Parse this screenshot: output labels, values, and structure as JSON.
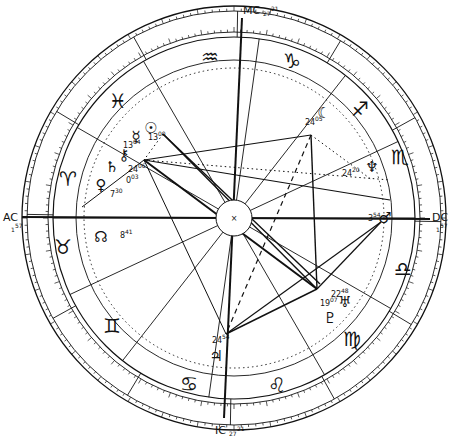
{
  "chart": {
    "center": [
      234,
      218
    ],
    "radii": {
      "outer": 212,
      "outer2": 207,
      "zodiac_inner": 186,
      "zodiac_inner2": 181,
      "house": 158,
      "hub": 18
    },
    "colors": {
      "line": "#111111",
      "background": "#ffffff"
    }
  },
  "angles": {
    "ac": {
      "label": "AC",
      "deg": "1",
      "min": "57"
    },
    "dc": {
      "label": "DC",
      "deg": "1",
      "min": "57"
    },
    "mc": {
      "label": "MC",
      "deg": "27",
      "min": "21"
    },
    "ic": {
      "label": "IC",
      "deg": "27",
      "min": "21"
    }
  },
  "signs": [
    {
      "name": "aquarius",
      "glyph": "♒",
      "x": 210,
      "y": 58
    },
    {
      "name": "capricorn",
      "glyph": "♑",
      "x": 292,
      "y": 62
    },
    {
      "name": "sagittarius",
      "glyph": "♐",
      "x": 360,
      "y": 110
    },
    {
      "name": "scorpio",
      "glyph": "♏",
      "x": 400,
      "y": 158
    },
    {
      "name": "libra",
      "glyph": "♎",
      "x": 403,
      "y": 270
    },
    {
      "name": "virgo",
      "glyph": "♍",
      "x": 352,
      "y": 340
    },
    {
      "name": "leo",
      "glyph": "♌",
      "x": 277,
      "y": 386
    },
    {
      "name": "cancer",
      "glyph": "♋",
      "x": 189,
      "y": 385
    },
    {
      "name": "gemini",
      "glyph": "♊",
      "x": 112,
      "y": 327
    },
    {
      "name": "taurus",
      "glyph": "♉",
      "x": 63,
      "y": 248
    },
    {
      "name": "aries",
      "glyph": "♈",
      "x": 68,
      "y": 180
    },
    {
      "name": "pisces",
      "glyph": "♓",
      "x": 118,
      "y": 102
    }
  ],
  "planets": [
    {
      "name": "sun",
      "glyph": "☉",
      "x": 151,
      "y": 128,
      "deg": "13",
      "min": "00",
      "dx": 148,
      "dy": 140
    },
    {
      "name": "mercury",
      "glyph": "☿",
      "x": 136,
      "y": 137,
      "deg": "13",
      "min": "04",
      "dx": 123,
      "dy": 148
    },
    {
      "name": "chiron",
      "glyph": "⚷",
      "x": 124,
      "y": 155,
      "deg": "24",
      "min": "06",
      "dx": 128,
      "dy": 172
    },
    {
      "name": "saturn",
      "glyph": "♄",
      "x": 112,
      "y": 167,
      "deg": "0",
      "min": "03",
      "dx": 126,
      "dy": 183
    },
    {
      "name": "venus",
      "glyph": "♀",
      "x": 101,
      "y": 185,
      "deg": "7",
      "min": "30",
      "dx": 110,
      "dy": 197
    },
    {
      "name": "mars",
      "glyph": "♂",
      "x": 385,
      "y": 218,
      "deg": "3",
      "min": "54",
      "dx": 368,
      "dy": 221
    },
    {
      "name": "jupiter",
      "glyph": "♃",
      "x": 216,
      "y": 356,
      "deg": "24",
      "min": "54",
      "dx": 212,
      "dy": 343
    },
    {
      "name": "moon",
      "glyph": "☾",
      "x": 324,
      "y": 113,
      "deg": "24",
      "min": "05",
      "dx": 305,
      "dy": 125
    },
    {
      "name": "neptune",
      "glyph": "♆",
      "x": 372,
      "y": 167,
      "deg": "24",
      "min": "20",
      "dx": 342,
      "dy": 176
    },
    {
      "name": "uranus",
      "glyph": "♅",
      "x": 345,
      "y": 302,
      "deg": "22",
      "min": "48",
      "dx": 331,
      "dy": 297
    },
    {
      "name": "pluto",
      "glyph": "♇",
      "x": 330,
      "y": 318,
      "deg": "19",
      "min": "07",
      "dx": 320,
      "dy": 306
    },
    {
      "name": "node",
      "glyph": "☊",
      "x": 101,
      "y": 237,
      "deg": "8",
      "min": "41",
      "dx": 120,
      "dy": 238
    }
  ],
  "aspect_points": {
    "p_sun": [
      163,
      134
    ],
    "p_chiron": [
      144,
      160
    ],
    "p_moon": [
      311,
      135
    ],
    "p_neptune": [
      330,
      183
    ],
    "p_mars": [
      381,
      222
    ],
    "p_uranus": [
      317,
      289
    ],
    "p_jupiter": [
      226,
      334
    ]
  },
  "aspects": [
    {
      "from": [
        144,
        160
      ],
      "to": [
        317,
        289
      ],
      "style": "solid",
      "weight": 2
    },
    {
      "from": [
        163,
        134
      ],
      "to": [
        317,
        289
      ],
      "style": "solid",
      "weight": 1.4
    },
    {
      "from": [
        163,
        134
      ],
      "to": [
        320,
        284
      ],
      "style": "solid",
      "weight": 1.4
    },
    {
      "from": [
        144,
        160
      ],
      "to": [
        311,
        135
      ],
      "style": "solid",
      "weight": 1.2
    },
    {
      "from": [
        144,
        160
      ],
      "to": [
        390,
        200
      ],
      "style": "solid",
      "weight": 1.2
    },
    {
      "from": [
        311,
        135
      ],
      "to": [
        317,
        289
      ],
      "style": "solid",
      "weight": 1.4
    },
    {
      "from": [
        311,
        135
      ],
      "to": [
        226,
        334
      ],
      "style": "dashed",
      "weight": 1.2
    },
    {
      "from": [
        317,
        289
      ],
      "to": [
        226,
        334
      ],
      "style": "solid",
      "weight": 1.4
    },
    {
      "from": [
        381,
        222
      ],
      "to": [
        226,
        334
      ],
      "style": "solid",
      "weight": 1.2
    },
    {
      "from": [
        381,
        222
      ],
      "to": [
        317,
        289
      ],
      "style": "solid",
      "weight": 1.2
    },
    {
      "from": [
        144,
        160
      ],
      "to": [
        226,
        334
      ],
      "style": "solid",
      "weight": 1.0
    },
    {
      "from": [
        144,
        160
      ],
      "to": [
        82,
        207
      ],
      "style": "solid",
      "weight": 1.0
    },
    {
      "from": [
        144,
        160
      ],
      "to": [
        390,
        180
      ],
      "style": "dotted",
      "weight": 1.0
    },
    {
      "from": [
        311,
        135
      ],
      "to": [
        372,
        180
      ],
      "style": "dotted",
      "weight": 1.0
    },
    {
      "from": [
        163,
        134
      ],
      "to": [
        144,
        160
      ],
      "style": "dotted",
      "weight": 1.0
    }
  ],
  "house_cusps_deg": [
    180,
    205,
    232,
    262,
    300,
    330,
    0,
    25,
    52,
    82,
    120,
    150
  ]
}
